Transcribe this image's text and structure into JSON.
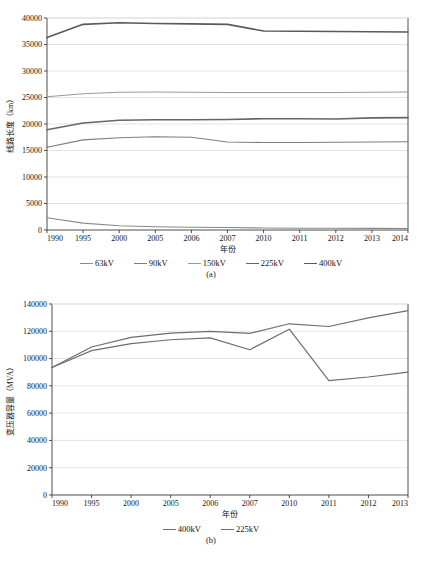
{
  "figure": {
    "panels": [
      {
        "caption": "(a)"
      },
      {
        "caption": "(b)"
      }
    ]
  },
  "chart_data": [
    {
      "type": "line",
      "panel": "(a)",
      "title": "",
      "xlabel": "年份",
      "ylabel": "线路长度（km）",
      "ylim": [
        0,
        40000
      ],
      "ytick_step": 5000,
      "yticks": [
        "0",
        "5000",
        "10000",
        "15000",
        "20000",
        "25000",
        "30000",
        "35000",
        "40000"
      ],
      "categories": [
        "1990",
        "1995",
        "2000",
        "2005",
        "2006",
        "2007",
        "2010",
        "2011",
        "2012",
        "2013",
        "2014"
      ],
      "grid": true,
      "legend_position": "bottom",
      "series": [
        {
          "name": "63kV",
          "color": "#8a8a8a",
          "width": 1.1,
          "values": [
            2300,
            1300,
            800,
            600,
            520,
            480,
            380,
            340,
            320,
            300,
            290
          ]
        },
        {
          "name": "90kV",
          "color": "#7e7e7e",
          "width": 1.1,
          "values": [
            15600,
            17000,
            17400,
            17600,
            17500,
            16600,
            16500,
            16500,
            16550,
            16600,
            16650
          ]
        },
        {
          "name": "150kV",
          "color": "#9a9a9a",
          "width": 1.1,
          "values": [
            25150,
            25700,
            26000,
            26050,
            26000,
            25950,
            25950,
            25950,
            25950,
            26000,
            26050
          ]
        },
        {
          "name": "225kV",
          "color": "#666666",
          "width": 1.6,
          "values": [
            18900,
            20200,
            20700,
            20800,
            20800,
            20850,
            21000,
            21000,
            20950,
            21150,
            21200
          ]
        },
        {
          "name": "400kV",
          "color": "#5a5a5a",
          "width": 1.6,
          "values": [
            36300,
            38800,
            39100,
            38950,
            38900,
            38800,
            37550,
            37500,
            37450,
            37400,
            37350
          ]
        }
      ]
    },
    {
      "type": "line",
      "panel": "(b)",
      "title": "",
      "xlabel": "年份",
      "ylabel": "变压器容量（MVA）",
      "ylim": [
        0,
        140000
      ],
      "ytick_step": 20000,
      "yticks": [
        "0",
        "20000",
        "40000",
        "60000",
        "80000",
        "100000",
        "120000",
        "140000"
      ],
      "categories": [
        "1990",
        "1995",
        "2000",
        "2005",
        "2006",
        "2007",
        "2010",
        "2011",
        "2012",
        "2013"
      ],
      "grid": true,
      "legend_position": "bottom",
      "series": [
        {
          "name": "400kV",
          "color": "#6e6e6e",
          "width": 1.2,
          "values": [
            93500,
            108500,
            115500,
            118700,
            119900,
            118500,
            125500,
            123500,
            129800,
            135200
          ]
        },
        {
          "name": "225kV",
          "color": "#6e6e6e",
          "width": 1.2,
          "values": [
            93500,
            105800,
            111000,
            113800,
            115200,
            106500,
            121500,
            83800,
            86500,
            90000
          ]
        }
      ]
    }
  ],
  "legend_a": [
    {
      "label": "63kV",
      "color": "#8a8a8a"
    },
    {
      "label": "90kV",
      "color": "#7e7e7e"
    },
    {
      "label": "150kV",
      "color": "#9a9a9a"
    },
    {
      "label": "225kV",
      "color": "#666666"
    },
    {
      "label": "400kV",
      "color": "#5a5a5a"
    }
  ],
  "legend_b": [
    {
      "label": "400kV",
      "color": "#6e6e6e"
    },
    {
      "label": "225kV",
      "color": "#6e6e6e"
    }
  ],
  "colors": {
    "axis": "#3a3a3a",
    "grid": "#d8d8d8",
    "text": "#141414",
    "background": "#ffffff"
  }
}
